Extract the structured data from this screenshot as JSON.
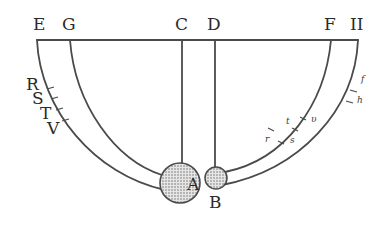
{
  "diagram": {
    "top_labels": [
      {
        "id": "E",
        "text": "E",
        "x": 40
      },
      {
        "id": "G",
        "text": "G",
        "x": 70
      },
      {
        "id": "C",
        "text": "C",
        "x": 182
      },
      {
        "id": "D",
        "text": "D",
        "x": 215
      },
      {
        "id": "F",
        "text": "F",
        "x": 331
      },
      {
        "id": "H",
        "text": "II",
        "x": 358
      }
    ],
    "left_arc_labels": [
      {
        "id": "R",
        "text": "R"
      },
      {
        "id": "S",
        "text": "S"
      },
      {
        "id": "T",
        "text": "T"
      },
      {
        "id": "V",
        "text": "V"
      }
    ],
    "right_arc_labels": [
      {
        "id": "v",
        "text": "υ"
      },
      {
        "id": "t",
        "text": "t"
      },
      {
        "id": "s",
        "text": "s"
      },
      {
        "id": "r",
        "text": "r"
      },
      {
        "id": "f",
        "text": "f"
      },
      {
        "id": "h",
        "text": "h"
      }
    ],
    "bodies": [
      {
        "id": "A",
        "text": "A",
        "label": "Ball A (large)"
      },
      {
        "id": "B",
        "text": "B",
        "label": "Ball B (small)"
      }
    ],
    "colors": {
      "line": "#4a4a4a",
      "text": "#2b2b2b",
      "ball_fill": "#d9d9d9"
    }
  }
}
